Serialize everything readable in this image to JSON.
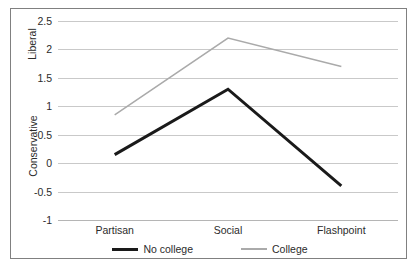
{
  "chart_data": {
    "type": "line",
    "title": "",
    "subtitle": "",
    "xlabel": "",
    "ylabel": "",
    "categories": [
      "Partisan",
      "Social",
      "Flashpoint"
    ],
    "series": [
      {
        "name": "No college",
        "values": [
          0.15,
          1.3,
          -0.4
        ],
        "color": "#1a1a1a",
        "line_width": 3,
        "legend_style": "thick"
      },
      {
        "name": "College",
        "values": [
          0.85,
          2.2,
          1.7
        ],
        "color": "#aaaaaa",
        "line_width": 1.5,
        "legend_style": "thin"
      }
    ],
    "ylim": [
      -1,
      2.5
    ],
    "ytick_values": [
      2.5,
      2,
      1.5,
      1,
      0.5,
      0,
      -0.5,
      -1
    ],
    "ytick_labels": [
      "2.5",
      "2",
      "1.5",
      "1",
      "0.5",
      "0",
      "-0.5",
      "-1"
    ],
    "y_axis_titles": [
      "Liberal",
      "Conservative"
    ],
    "grid": true,
    "grid_color": "#c9c9c9",
    "legend_position": "bottom",
    "plot_background": "#ffffff",
    "border_color": "#808080"
  },
  "axis": {
    "liberal_label": "Liberal",
    "conservative_label": "Conservative"
  },
  "legend": {
    "entries": [
      {
        "label": "No college"
      },
      {
        "label": "College"
      }
    ]
  }
}
